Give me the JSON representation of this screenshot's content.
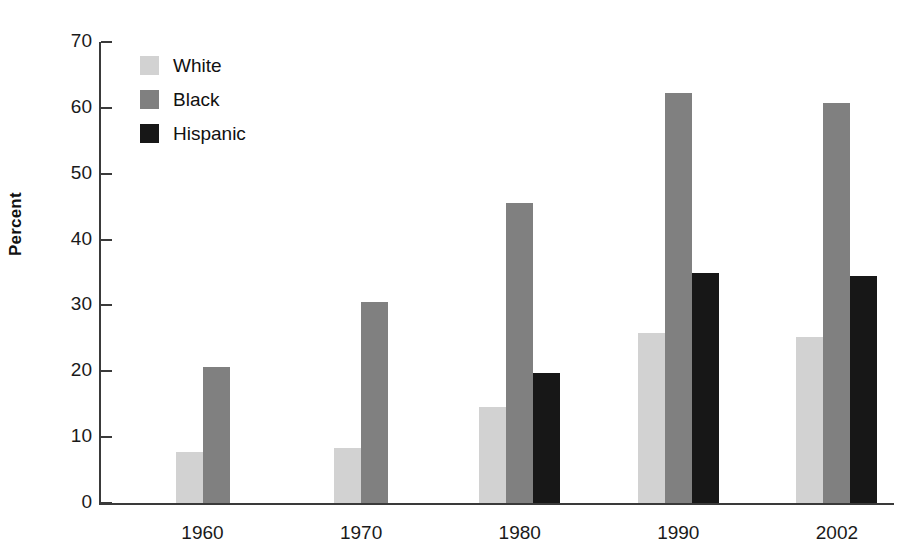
{
  "chart_data": {
    "type": "bar",
    "title": "",
    "xlabel": "",
    "ylabel": "Percent",
    "ylim": [
      0,
      70
    ],
    "yticks": [
      0,
      10,
      20,
      30,
      40,
      50,
      60,
      70
    ],
    "ytick_labels": [
      "0",
      "10",
      "20",
      "30",
      "40",
      "50",
      "60",
      "70"
    ],
    "grid": false,
    "legend_position": "top-left-inside",
    "categories": [
      "1960",
      "1970",
      "1980",
      "1990",
      "2002"
    ],
    "series": [
      {
        "name": "White",
        "color": "#d2d2d2",
        "values": [
          7.7,
          8.4,
          14.6,
          25.8,
          25.2
        ]
      },
      {
        "name": "Black",
        "color": "#808080",
        "values": [
          20.6,
          30.5,
          45.6,
          62.2,
          60.8
        ]
      },
      {
        "name": "Hispanic",
        "color": "#171717",
        "values": [
          null,
          null,
          19.7,
          34.9,
          34.4
        ]
      }
    ]
  },
  "axis": {
    "y_title": "Percent"
  }
}
